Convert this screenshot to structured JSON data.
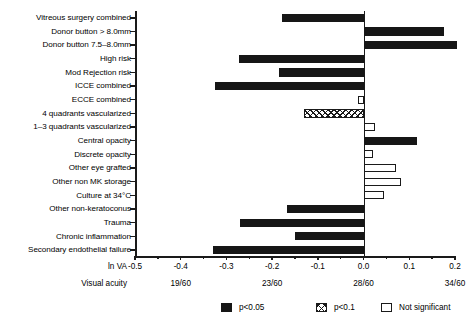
{
  "chart_data": {
    "type": "bar",
    "orientation": "horizontal",
    "title": "",
    "xlabel": "ln VA",
    "ylabel": "",
    "xlim": [
      -0.5,
      0.2
    ],
    "grid": false,
    "zero_reference": 0.0,
    "xticks": [
      "-0.5",
      "-0.4",
      "-0.3",
      "-0.2",
      "-0.1",
      "0.0",
      "0.1",
      "0.2"
    ],
    "xtick_values": [
      -0.5,
      -0.4,
      -0.3,
      -0.2,
      -0.1,
      0.0,
      0.1,
      0.2
    ],
    "secondary_axis_label": "Visual acuity",
    "secondary_axis_ticks": [
      {
        "value": -0.4,
        "label": "19/60"
      },
      {
        "value": -0.2,
        "label": "23/60"
      },
      {
        "value": 0.0,
        "label": "28/60"
      },
      {
        "value": 0.2,
        "label": "34/60"
      }
    ],
    "legend_position": "bottom",
    "legend": [
      {
        "key": "sig",
        "label": "p<0.05",
        "style": "filled-black"
      },
      {
        "key": "marg",
        "label": "p<0.1",
        "style": "cross-hatched"
      },
      {
        "key": "ns",
        "label": "Not significant",
        "style": "open-white"
      }
    ],
    "categories": [
      "Vitreous surgery combined",
      "Donor button > 8.0mm",
      "Donor button 7.5–8.0mm",
      "High risk",
      "Mod Rejection risk",
      "ICCE combined",
      "ECCE combined",
      "4 quadrants vascularized",
      "1–3 quadrants vascularized",
      "Central opacity",
      "Discrete opacity",
      "Other eye grafted",
      "Other non MK storage",
      "Culture at 34°C",
      "Other non-keratoconus",
      "Trauma",
      "Chronic inflammation",
      "Secondary endothelial failure"
    ],
    "values": [
      -0.178,
      0.175,
      0.205,
      -0.272,
      -0.186,
      -0.324,
      -0.013,
      -0.131,
      0.026,
      0.117,
      0.02,
      0.07,
      0.082,
      0.044,
      -0.168,
      -0.27,
      -0.151,
      -0.33
    ],
    "significance": [
      "sig",
      "sig",
      "sig",
      "sig",
      "sig",
      "sig",
      "ns",
      "marg",
      "ns",
      "sig",
      "ns",
      "ns",
      "ns",
      "ns",
      "sig",
      "sig",
      "sig",
      "sig"
    ]
  },
  "caption": ""
}
